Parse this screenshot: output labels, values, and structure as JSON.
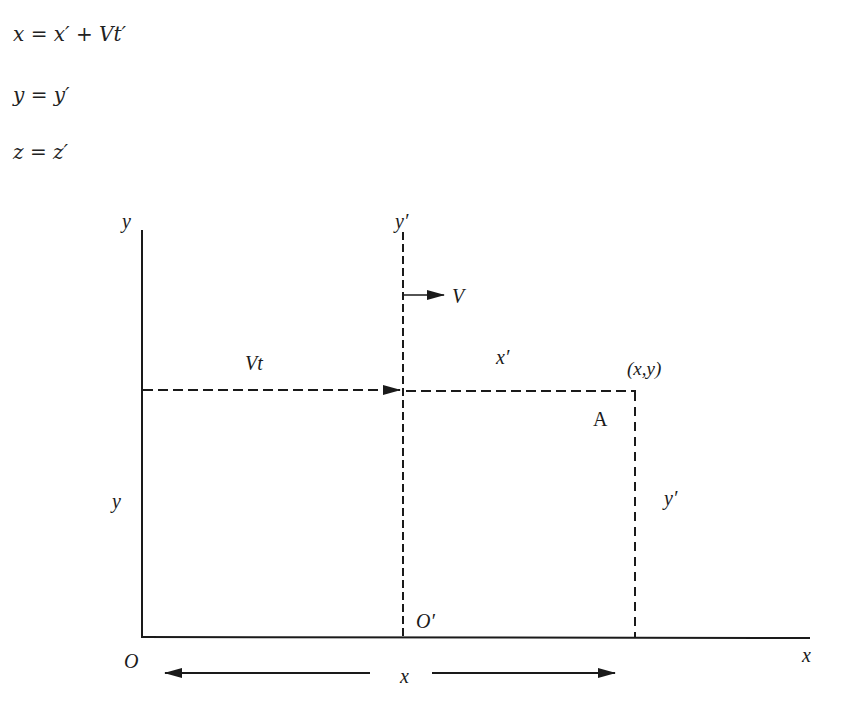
{
  "equations": [
    "x = x′ + Vt′",
    "y = y′",
    "z = z′"
  ],
  "diagram": {
    "labels": {
      "y_axis": "y",
      "y_prime_axis": "y′",
      "velocity": "V",
      "vt": "Vt",
      "x_prime": "x′",
      "point_coords": "(x,y)",
      "point_name": "A",
      "y_left": "y",
      "y_prime_right": "y′",
      "origin_prime": "O′",
      "origin": "O",
      "x_axis": "x",
      "x_distance": "x"
    },
    "colors": {
      "ink": "#1a1a1a",
      "background": "#ffffff"
    }
  }
}
